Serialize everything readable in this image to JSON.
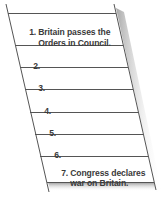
{
  "diagram": {
    "type": "slanted-sequence-ladder",
    "colors": {
      "line": "#555555",
      "text": "#3a3a3a",
      "shadow": "#9a9a9a",
      "background": "#ffffff"
    },
    "rows": [
      {
        "number": "1.",
        "line1": "Britain passes the",
        "line2": "Orders in Council."
      },
      {
        "number": "2.",
        "line1": "",
        "line2": ""
      },
      {
        "number": "3.",
        "line1": "",
        "line2": ""
      },
      {
        "number": "4.",
        "line1": "",
        "line2": ""
      },
      {
        "number": "5.",
        "line1": "",
        "line2": ""
      },
      {
        "number": "6.",
        "line1": "",
        "line2": ""
      },
      {
        "number": "7.",
        "line1": "Congress declares",
        "line2": "war on Britain."
      }
    ]
  }
}
